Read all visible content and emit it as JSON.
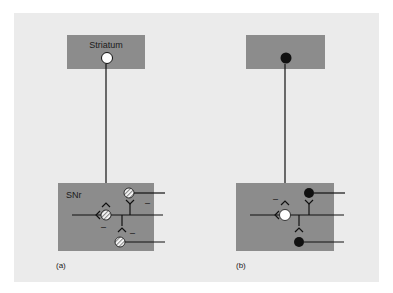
{
  "figure": {
    "background": "#ebebeb",
    "box_color": "#8c8c8c",
    "line_color": "#111111"
  },
  "panel_a": {
    "caption": "(a)",
    "top_box_label": "Striatum",
    "bottom_box_label": "SNr",
    "striatal_neuron": "open-circle",
    "snr_neurons": "hatched-circle",
    "signs": [
      "–",
      "–",
      "–"
    ]
  },
  "panel_b": {
    "caption": "(b)",
    "top_box_label": "",
    "striatal_neuron": "filled-circle",
    "central_neuron": "open-circle",
    "snr_neurons": "filled-circle",
    "signs": [
      "–"
    ]
  }
}
